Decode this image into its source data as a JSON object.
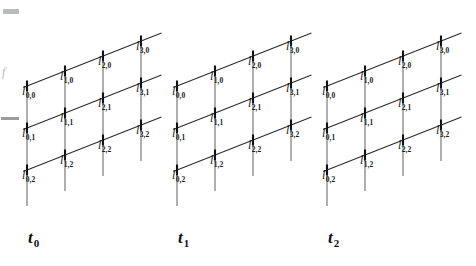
{
  "figure": {
    "background_color": "#ffffff",
    "margin_marks": {
      "bar_color": "#b9bcbe",
      "rule_color": "#9a9d9f",
      "f_glyph": "f",
      "f_color": "#b6b9bb"
    },
    "geometry": {
      "group_offsets_x": [
        0,
        150,
        300
      ],
      "origin_x": 27,
      "origin_y": 86,
      "step_right_x": 38,
      "step_right_y": -15,
      "step_down_y": 42,
      "columns": 4,
      "rows": 3,
      "diagonal_color": "#2b2b2b",
      "diagonal_width": 1.1,
      "vertical_color": "#9b9b9b",
      "vertical_width": 1.6,
      "node_tick_color": "#111111",
      "node_tick_width": 2.1,
      "node_tick_height": 11,
      "diagonal_lead_in": 4,
      "diagonal_lead_out": 22,
      "vertical_tail": 36
    },
    "node_label_symbol": "l",
    "nodes": [
      {
        "i": 0,
        "j": 0,
        "symbol": "l",
        "sub": "0,0"
      },
      {
        "i": 1,
        "j": 0,
        "symbol": "l",
        "sub": "1,0"
      },
      {
        "i": 2,
        "j": 0,
        "symbol": "l",
        "sub": "2,0"
      },
      {
        "i": 3,
        "j": 0,
        "symbol": "l",
        "sub": "3,0"
      },
      {
        "i": 0,
        "j": 1,
        "symbol": "l",
        "sub": "0,1"
      },
      {
        "i": 1,
        "j": 1,
        "symbol": "l",
        "sub": "1,1"
      },
      {
        "i": 2,
        "j": 1,
        "symbol": "l",
        "sub": "2,1"
      },
      {
        "i": 3,
        "j": 1,
        "symbol": "l",
        "sub": "3,1"
      },
      {
        "i": 0,
        "j": 2,
        "symbol": "l",
        "sub": "0,2"
      },
      {
        "i": 1,
        "j": 2,
        "symbol": "l",
        "sub": "1,2"
      },
      {
        "i": 2,
        "j": 2,
        "symbol": "l",
        "sub": "2,2"
      },
      {
        "i": 3,
        "j": 2,
        "symbol": "l",
        "sub": "3,2"
      }
    ],
    "groups": [
      {
        "id": "t0",
        "symbol": "t",
        "sub": "0",
        "label_x": 28,
        "label_y": 243
      },
      {
        "id": "t1",
        "symbol": "t",
        "sub": "1",
        "label_x": 178,
        "label_y": 243
      },
      {
        "id": "t2",
        "symbol": "t",
        "sub": "2",
        "label_x": 328,
        "label_y": 243
      }
    ]
  }
}
